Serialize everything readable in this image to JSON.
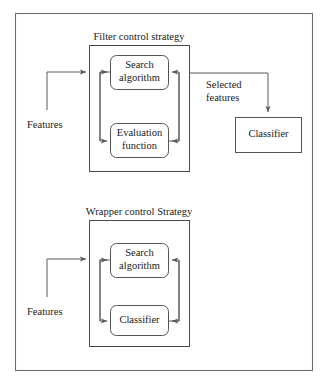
{
  "diagram": {
    "title_filter": "Filter control strategy",
    "title_wrapper": "Wrapper control Strategy",
    "labels": {
      "features_top": "Features",
      "features_bottom": "Features",
      "selected_features_line1": "Selected",
      "selected_features_line2": "features"
    },
    "filter_section": {
      "node_search_line1": "Search",
      "node_search_line2": "algorithm",
      "node_eval_line1": "Evaluation",
      "node_eval_line2": "function"
    },
    "wrapper_section": {
      "node_search_line1": "Search",
      "node_search_line2": "algorithm",
      "node_classifier": "Classifier"
    },
    "external": {
      "classifier": "Classifier"
    },
    "colors": {
      "frame": "#6e6e6e",
      "box": "#4a4a4a",
      "node": "#555555",
      "connector": "#5a5a5a",
      "text": "#1a1a1a",
      "background": "#ffffff"
    }
  }
}
